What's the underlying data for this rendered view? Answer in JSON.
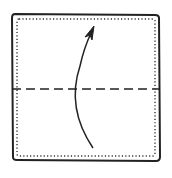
{
  "diagram": {
    "type": "origami-fold-step",
    "description": "Square paper with a horizontal valley-fold dashed line through the middle and a curved arrow indicating folding the bottom half up",
    "colors": {
      "background": "#ffffff",
      "ink": "#222222"
    },
    "paper": {
      "outline": "solid",
      "inner_border": "dotted"
    },
    "fold_line": {
      "style": "dashed",
      "orientation": "horizontal",
      "position": "middle"
    },
    "arrow": {
      "direction": "up",
      "shape": "curved"
    }
  }
}
